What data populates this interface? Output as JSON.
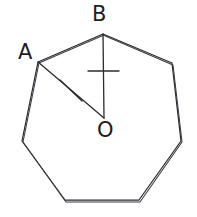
{
  "figure": {
    "kind": "geometry-diagram",
    "background_color": "#ffffff",
    "stroke_color": "#2b2b33",
    "labels": {
      "vertex_a": "A",
      "vertex_b": "B",
      "center_o": "O"
    },
    "label_positions": {
      "vertex_a": {
        "x": 18,
        "y": 42
      },
      "vertex_b": {
        "x": 92,
        "y": 4
      },
      "center_o": {
        "x": 97,
        "y": 120
      }
    },
    "polygon": {
      "type": "heptagon",
      "sides": 7,
      "vertex_count": 7,
      "hand_drawn_double_stroke": true,
      "points": "103,34 172,63 181,141 139,200 65,200 22,141 38,62",
      "points_overdraw": "103,35 173,65 182,142 140,202 66,202 23,142 39,63 104,35"
    },
    "center_point": {
      "x": 104,
      "y": 118
    },
    "radii": [
      {
        "name": "OB",
        "from": {
          "x": 104,
          "y": 118
        },
        "to": {
          "x": 103,
          "y": 34
        },
        "tick_mark": "single-perpendicular-dash",
        "tick_center": {
          "x": 103,
          "y": 71
        }
      },
      {
        "name": "OA",
        "from": {
          "x": 104,
          "y": 118
        },
        "to": {
          "x": 38,
          "y": 62
        },
        "tick_mark": "single-slash",
        "tick_center": {
          "x": 71,
          "y": 90
        }
      }
    ]
  }
}
